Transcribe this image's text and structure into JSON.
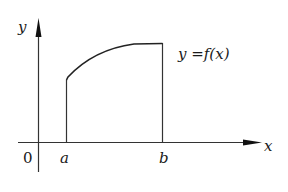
{
  "diagram": {
    "type": "function-area-under-curve",
    "axes": {
      "x_label": "x",
      "y_label": "y",
      "origin_label": "0"
    },
    "bounds": {
      "a_label": "a",
      "b_label": "b"
    },
    "curve": {
      "label": "y =f(x)",
      "description": "increasing concave-down curve from x=a to x=b"
    },
    "colors": {
      "stroke": "#1a1a1a",
      "background": "#ffffff"
    }
  }
}
